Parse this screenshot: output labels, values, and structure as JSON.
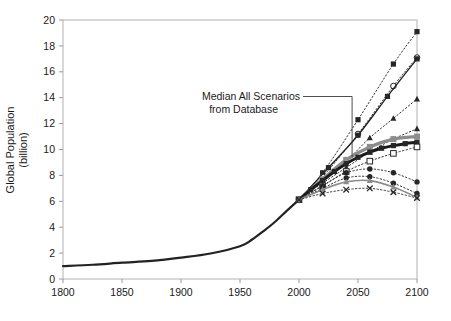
{
  "chart_data": {
    "type": "line",
    "title": "",
    "xlabel": "",
    "ylabel": "Global Population (billion)",
    "xlim": [
      1800,
      2100
    ],
    "ylim": [
      0,
      20
    ],
    "xticks": [
      1800,
      1850,
      1900,
      1950,
      2000,
      2050,
      2100
    ],
    "xtick_labels": [
      "1800",
      "1850",
      "1900",
      "1950",
      "2000",
      "2050",
      "2100"
    ],
    "yticks": [
      0,
      2,
      4,
      6,
      8,
      10,
      12,
      14,
      16,
      18,
      20
    ],
    "ytick_labels": [
      "0",
      "2",
      "4",
      "6",
      "8",
      "10",
      "12",
      "14",
      "16",
      "18",
      "20"
    ],
    "grid": false,
    "legend": "none",
    "annotations": [
      {
        "name": "median-annotation",
        "text_line1": "Median All Scenarios",
        "text_line2": "from Database",
        "points_to_x": 2045,
        "points_to_y": 9.4
      }
    ],
    "series": [
      {
        "name": "Historical",
        "style": "solid",
        "color": "#222222",
        "width": 2.2,
        "marker": "none",
        "x": [
          1800,
          1825,
          1850,
          1875,
          1900,
          1925,
          1950,
          1960,
          1970,
          1980,
          1990,
          2000
        ],
        "values": [
          1.0,
          1.1,
          1.26,
          1.4,
          1.65,
          1.97,
          2.53,
          3.03,
          3.7,
          4.44,
          5.3,
          6.12
        ]
      },
      {
        "name": "Scenario High 1",
        "style": "dotted",
        "color": "#333333",
        "width": 1.0,
        "marker": "square-filled",
        "x": [
          2000,
          2020,
          2050,
          2080,
          2100
        ],
        "values": [
          6.12,
          8.2,
          12.3,
          16.6,
          19.1
        ]
      },
      {
        "name": "Scenario High 2",
        "style": "dotted",
        "color": "#333333",
        "width": 1.0,
        "marker": "circle-open",
        "x": [
          2000,
          2020,
          2050,
          2080,
          2100
        ],
        "values": [
          6.12,
          7.9,
          11.2,
          14.9,
          17.1
        ]
      },
      {
        "name": "Scenario High 3",
        "style": "solid",
        "color": "#222222",
        "width": 1.3,
        "marker": "square-filled",
        "x": [
          2000,
          2025,
          2050,
          2075,
          2100
        ],
        "values": [
          6.12,
          8.6,
          11.1,
          14.1,
          17.0
        ]
      },
      {
        "name": "Scenario High 4",
        "style": "dotted",
        "color": "#333333",
        "width": 1.0,
        "marker": "triangle-filled",
        "x": [
          2000,
          2020,
          2040,
          2060,
          2080,
          2100
        ],
        "values": [
          6.12,
          7.6,
          9.1,
          10.9,
          12.4,
          13.9
        ]
      },
      {
        "name": "Scenario Mid High",
        "style": "dotted",
        "color": "#333333",
        "width": 1.0,
        "marker": "triangle-filled",
        "x": [
          2000,
          2020,
          2040,
          2060,
          2080,
          2100
        ],
        "values": [
          6.12,
          7.4,
          8.6,
          9.8,
          10.8,
          11.6
        ]
      },
      {
        "name": "Upper Band (gray)",
        "style": "solid",
        "color": "#8c8c8c",
        "width": 3.2,
        "marker": "square-filled-gray",
        "x": [
          2000,
          2020,
          2040,
          2060,
          2080,
          2100
        ],
        "values": [
          6.12,
          7.7,
          9.2,
          10.2,
          10.8,
          11.0
        ]
      },
      {
        "name": "Median All Scenarios from Database",
        "style": "solid",
        "color": "#1a1a1a",
        "width": 3.0,
        "marker": "square-filled",
        "x": [
          2000,
          2010,
          2020,
          2030,
          2040,
          2050,
          2060,
          2070,
          2080,
          2090,
          2100
        ],
        "values": [
          6.12,
          6.9,
          7.6,
          8.3,
          8.9,
          9.4,
          9.8,
          10.1,
          10.3,
          10.45,
          10.55
        ]
      },
      {
        "name": "Scenario Mid Low",
        "style": "dotted",
        "color": "#333333",
        "width": 1.0,
        "marker": "square-open",
        "x": [
          2000,
          2020,
          2040,
          2060,
          2080,
          2100
        ],
        "values": [
          6.12,
          7.2,
          8.3,
          9.1,
          9.7,
          10.2
        ]
      },
      {
        "name": "Scenario Low 1",
        "style": "dotted",
        "color": "#333333",
        "width": 1.0,
        "marker": "circle-filled",
        "x": [
          2000,
          2020,
          2040,
          2060,
          2080,
          2100
        ],
        "values": [
          6.12,
          7.2,
          8.2,
          8.5,
          8.2,
          7.5
        ]
      },
      {
        "name": "Scenario Low 2",
        "style": "dotted",
        "color": "#333333",
        "width": 1.0,
        "marker": "circle-filled",
        "x": [
          2000,
          2020,
          2040,
          2060,
          2080,
          2100
        ],
        "values": [
          6.12,
          7.0,
          7.8,
          7.9,
          7.4,
          6.6
        ]
      },
      {
        "name": "Scenario Low 3 (gray)",
        "style": "solid",
        "color": "#8c8c8c",
        "width": 1.6,
        "marker": "triangle-filled-gray",
        "x": [
          2000,
          2020,
          2040,
          2060,
          2080,
          2100
        ],
        "values": [
          6.12,
          6.9,
          7.5,
          7.6,
          7.1,
          6.3
        ]
      },
      {
        "name": "Scenario Low 4",
        "style": "dotted",
        "color": "#333333",
        "width": 1.0,
        "marker": "x",
        "x": [
          2000,
          2020,
          2040,
          2060,
          2080,
          2100
        ],
        "values": [
          6.12,
          6.6,
          6.9,
          7.0,
          6.7,
          6.25
        ]
      }
    ]
  }
}
